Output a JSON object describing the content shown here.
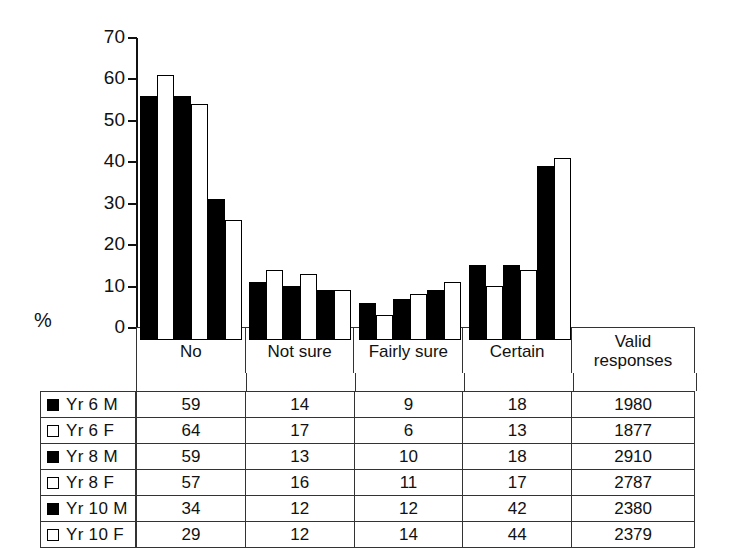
{
  "axis": {
    "unit_label": "%",
    "ticks": [
      70,
      60,
      50,
      40,
      30,
      20,
      10,
      0
    ]
  },
  "table": {
    "headers": [
      "No",
      "Not sure",
      "Fairly sure",
      "Certain",
      "Valid responses"
    ],
    "valid_header_line1": "Valid",
    "valid_header_line2": "responses",
    "rows": [
      {
        "label": "Yr 6 M",
        "swatch": "filled",
        "no": "59",
        "not_sure": "14",
        "fairly_sure": "9",
        "certain": "18",
        "valid": "1980"
      },
      {
        "label": "Yr 6 F",
        "swatch": "hollow",
        "no": "64",
        "not_sure": "17",
        "fairly_sure": "6",
        "certain": "13",
        "valid": "1877"
      },
      {
        "label": "Yr 8 M",
        "swatch": "filled",
        "no": "59",
        "not_sure": "13",
        "fairly_sure": "10",
        "certain": "18",
        "valid": "2910"
      },
      {
        "label": "Yr 8 F",
        "swatch": "hollow",
        "no": "57",
        "not_sure": "16",
        "fairly_sure": "11",
        "certain": "17",
        "valid": "2787"
      },
      {
        "label": "Yr 10 M",
        "swatch": "filled",
        "no": "34",
        "not_sure": "12",
        "fairly_sure": "12",
        "certain": "42",
        "valid": "2380"
      },
      {
        "label": "Yr 10 F",
        "swatch": "hollow",
        "no": "29",
        "not_sure": "12",
        "fairly_sure": "14",
        "certain": "44",
        "valid": "2379"
      }
    ]
  },
  "colors": {
    "male_bar": "#000000",
    "female_bar": "#ffffff",
    "outline": "#000000",
    "grid": "#333333",
    "background": "#ffffff"
  },
  "chart_data": {
    "type": "bar",
    "title": "",
    "subtitle": "",
    "xlabel": "",
    "ylabel": "%",
    "ylim": [
      0,
      70
    ],
    "ytick_step": 10,
    "grid": false,
    "legend_position": "bottom-left-table",
    "categories": [
      "No",
      "Not sure",
      "Fairly sure",
      "Certain"
    ],
    "series": [
      {
        "name": "Yr 6 M",
        "fill": "black",
        "values": [
          59,
          14,
          9,
          18
        ],
        "valid_responses": 1980
      },
      {
        "name": "Yr 6 F",
        "fill": "white",
        "values": [
          64,
          17,
          6,
          13
        ],
        "valid_responses": 1877
      },
      {
        "name": "Yr 8 M",
        "fill": "black",
        "values": [
          59,
          13,
          10,
          18
        ],
        "valid_responses": 2910
      },
      {
        "name": "Yr 8 F",
        "fill": "white",
        "values": [
          57,
          16,
          11,
          17
        ],
        "valid_responses": 2787
      },
      {
        "name": "Yr 10 M",
        "fill": "black",
        "values": [
          34,
          12,
          12,
          42
        ],
        "valid_responses": 2380
      },
      {
        "name": "Yr 10 F",
        "fill": "white",
        "values": [
          29,
          12,
          14,
          44
        ],
        "valid_responses": 2379
      }
    ],
    "extra_column": {
      "name": "Valid responses",
      "values": [
        1980,
        1877,
        2910,
        2787,
        2380,
        2379
      ]
    }
  }
}
